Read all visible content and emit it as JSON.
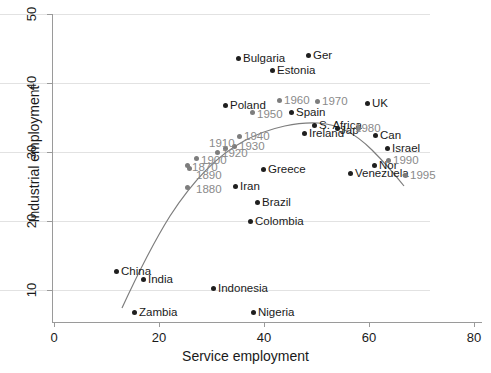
{
  "chart_data": {
    "type": "scatter",
    "title": "",
    "xlabel": "Service employment",
    "ylabel": "Industrial employment",
    "xlim": [
      0,
      80
    ],
    "ylim": [
      7,
      51
    ],
    "xticks": [
      0,
      20,
      40,
      60,
      80
    ],
    "yticks": [
      10,
      20,
      30,
      40,
      50
    ],
    "grid": "horizontal",
    "legend": "none",
    "series": [
      {
        "name": "Countries",
        "color": "#1f1f1f",
        "points": [
          {
            "label": "Bulgaria",
            "x": 35.0,
            "y": 44.7,
            "lx": 243,
            "ly": 58,
            "px": 238,
            "py": 58
          },
          {
            "label": "Ger",
            "x": 48.4,
            "y": 45.2,
            "lx": 313,
            "ly": 55,
            "px": 308,
            "py": 55
          },
          {
            "label": "Estonia",
            "x": 41.6,
            "y": 43.2,
            "lx": 277,
            "ly": 70,
            "px": 272,
            "py": 70
          },
          {
            "label": "Poland",
            "x": 32.0,
            "y": 37.6,
            "lx": 230,
            "ly": 105,
            "px": 225,
            "py": 105
          },
          {
            "label": "Spain",
            "x": 44.8,
            "y": 36.6,
            "lx": 296,
            "ly": 112,
            "px": 291,
            "py": 112
          },
          {
            "label": "UK",
            "x": 59.2,
            "y": 37.9,
            "lx": 372,
            "ly": 103,
            "px": 367,
            "py": 103
          },
          {
            "label": "S. Africa",
            "x": 50.5,
            "y": 34.7,
            "lx": 319,
            "ly": 125,
            "px": 314,
            "py": 125
          },
          {
            "label": "Ireland",
            "x": 47.6,
            "y": 33.7,
            "lx": 309,
            "ly": 133,
            "px": 304,
            "py": 133
          },
          {
            "label": "Jap",
            "x": 54.4,
            "y": 34.3,
            "lx": 340,
            "ly": 130,
            "px": 337,
            "py": 128
          },
          {
            "label": "Can",
            "x": 61.5,
            "y": 33.5,
            "lx": 380,
            "ly": 135,
            "px": 375,
            "py": 135
          },
          {
            "label": "Israel",
            "x": 64.0,
            "y": 31.5,
            "lx": 392,
            "ly": 148,
            "px": 387,
            "py": 148
          },
          {
            "label": "Nor",
            "x": 62.1,
            "y": 29.1,
            "lx": 379,
            "ly": 165,
            "px": 374,
            "py": 165
          },
          {
            "label": "Venezuela",
            "x": 57.3,
            "y": 28.0,
            "lx": 355,
            "ly": 173,
            "px": 350,
            "py": 173
          },
          {
            "label": "Greece",
            "x": 38.5,
            "y": 28.6,
            "lx": 268,
            "ly": 169,
            "px": 263,
            "py": 169
          },
          {
            "label": "Iran",
            "x": 34.4,
            "y": 26.2,
            "lx": 240,
            "ly": 186,
            "px": 235,
            "py": 186
          },
          {
            "label": "Brazil",
            "x": 37.0,
            "y": 24.0,
            "lx": 262,
            "ly": 202,
            "px": 257,
            "py": 202
          },
          {
            "label": "Colombia",
            "x": 36.0,
            "y": 21.1,
            "lx": 255,
            "ly": 221,
            "px": 250,
            "py": 221
          },
          {
            "label": "China",
            "x": 11.5,
            "y": 14.0,
            "lx": 121,
            "ly": 271,
            "px": 116,
            "py": 271
          },
          {
            "label": "India",
            "x": 17.2,
            "y": 13.0,
            "lx": 148,
            "ly": 279,
            "px": 143,
            "py": 279
          },
          {
            "label": "Indonesia",
            "x": 29.8,
            "y": 11.8,
            "lx": 218,
            "ly": 288,
            "px": 213,
            "py": 288
          },
          {
            "label": "Zambia",
            "x": 15.8,
            "y": 8.5,
            "lx": 139,
            "ly": 312,
            "px": 134,
            "py": 312
          },
          {
            "label": "Nigeria",
            "x": 37.5,
            "y": 8.5,
            "lx": 258,
            "ly": 312,
            "px": 253,
            "py": 312
          }
        ]
      },
      {
        "name": "Years (development path)",
        "color": "#7d7d7d",
        "points": [
          {
            "label": "1960",
            "x": 41.8,
            "y": 38.9,
            "lx": 284,
            "ly": 100,
            "px": 279,
            "py": 100
          },
          {
            "label": "1970",
            "x": 49.6,
            "y": 38.8,
            "lx": 322,
            "ly": 101,
            "px": 317,
            "py": 101
          },
          {
            "label": "1950",
            "x": 37.0,
            "y": 36.9,
            "lx": 257,
            "ly": 114,
            "px": 252,
            "py": 112
          },
          {
            "label": "1940",
            "x": 34.0,
            "y": 33.7,
            "lx": 244,
            "ly": 136,
            "px": 239,
            "py": 136
          },
          {
            "label": "1930",
            "x": 32.0,
            "y": 32.4,
            "lx": 239,
            "ly": 146,
            "px": 234,
            "py": 146
          },
          {
            "label": "1910",
            "x": 28.6,
            "y": 32.0,
            "lx": 209,
            "ly": 143,
            "px": 225,
            "py": 148
          },
          {
            "label": "1920",
            "x": 30.3,
            "y": 31.4,
            "lx": 222,
            "ly": 153,
            "px": 217,
            "py": 152
          },
          {
            "label": "1900",
            "x": 26.5,
            "y": 30.4,
            "lx": 201,
            "ly": 160,
            "px": 196,
            "py": 158
          },
          {
            "label": "1870",
            "x": 24.7,
            "y": 29.3,
            "lx": 192,
            "ly": 167,
            "px": 187,
            "py": 165
          },
          {
            "label": "1890",
            "x": 25.2,
            "y": 29.0,
            "lx": 196,
            "ly": 175,
            "px": 189,
            "py": 168
          },
          {
            "label": "1880",
            "x": 25.0,
            "y": 26.3,
            "lx": 196,
            "ly": 189,
            "px": 187,
            "py": 187
          },
          {
            "label": "1980",
            "x": 58.0,
            "y": 34.4,
            "lx": 355,
            "ly": 128,
            "px": 358,
            "py": 128
          },
          {
            "label": "1990",
            "x": 63.9,
            "y": 29.9,
            "lx": 393,
            "ly": 160,
            "px": 388,
            "py": 160
          },
          {
            "label": "1995",
            "x": 67.0,
            "y": 27.8,
            "lx": 410,
            "ly": 175,
            "px": 405,
            "py": 175
          }
        ]
      }
    ],
    "fit_curve": {
      "type": "quadratic-fit",
      "color": "#7d7d7d",
      "path": "M 122,308 C 134,282 150,248 170,216 C 192,182 216,156 244,141 C 272,126 300,122 318,123 C 338,124 356,134 372,150 C 386,164 396,176 404,186"
    }
  }
}
